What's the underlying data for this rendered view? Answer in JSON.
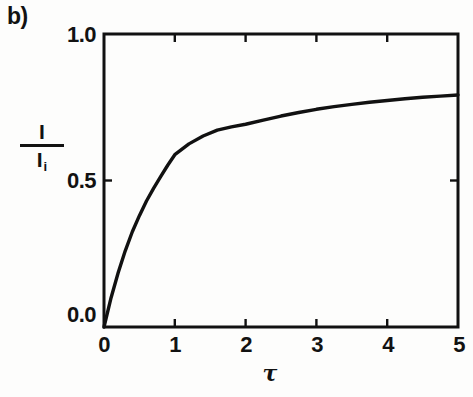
{
  "panel": {
    "label": "b)"
  },
  "chart_data": {
    "type": "line",
    "title": "",
    "subtitle": "",
    "panel_label": "b)",
    "xlabel": "τ",
    "ylabel_numerator": "I",
    "ylabel_denominator": "I",
    "ylabel_denominator_subscript": "i",
    "ylabel": "I / I_i",
    "xlim": [
      0,
      5
    ],
    "ylim": [
      0,
      1.0
    ],
    "xticks": [
      0,
      1,
      2,
      3,
      4,
      5
    ],
    "xtick_labels": [
      "0",
      "1",
      "2",
      "3",
      "4",
      "5"
    ],
    "yticks": [
      0.0,
      0.5,
      1.0
    ],
    "ytick_labels": [
      "0.0",
      "0.5",
      "1.0"
    ],
    "grid": false,
    "legend": false,
    "legend_position": "none",
    "tick_direction": "in",
    "frame": "box",
    "line_color": "#111111",
    "line_width": 3,
    "series": [
      {
        "name": "I/I_i",
        "x": [
          0.0,
          0.1,
          0.2,
          0.3,
          0.4,
          0.5,
          0.6,
          0.7,
          0.8,
          0.9,
          1.0,
          1.2,
          1.4,
          1.6,
          1.8,
          2.0,
          2.25,
          2.5,
          2.75,
          3.0,
          3.25,
          3.5,
          3.75,
          4.0,
          4.25,
          4.5,
          4.75,
          5.0
        ],
        "y": [
          0.0,
          0.1,
          0.185,
          0.26,
          0.325,
          0.38,
          0.43,
          0.473,
          0.513,
          0.552,
          0.588,
          0.625,
          0.652,
          0.672,
          0.683,
          0.692,
          0.706,
          0.72,
          0.732,
          0.743,
          0.752,
          0.76,
          0.767,
          0.773,
          0.779,
          0.784,
          0.788,
          0.792
        ]
      }
    ]
  },
  "axes": {
    "x_tick_labels": [
      "0",
      "1",
      "2",
      "3",
      "4",
      "5"
    ],
    "y_tick_labels": [
      "1.0",
      "0.5",
      "0.0"
    ],
    "x_axis_label": "τ",
    "y_axis_numerator": "I",
    "y_axis_denominator": "I",
    "y_axis_denominator_sub": "i"
  },
  "colors": {
    "background": "#fdfdfc",
    "ink": "#121212",
    "curve": "#111111"
  }
}
